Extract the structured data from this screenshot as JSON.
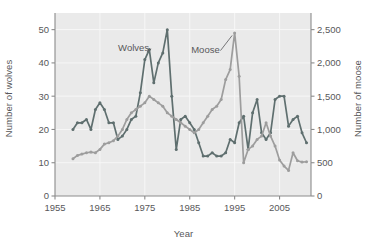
{
  "chart_data": {
    "type": "line",
    "title": "",
    "xlabel": "Year",
    "ylabel": "Number of wolves",
    "ylabel_right": "Number of moose",
    "grid": true,
    "legend_position": "inline-annotations",
    "xlim": [
      1955,
      2012
    ],
    "xticks": [
      1955,
      1965,
      1975,
      1985,
      1995,
      2005
    ],
    "xtick_labels": [
      "1955",
      "1965",
      "1975",
      "1985",
      "1995",
      "2005"
    ],
    "ylim_left": [
      0,
      55
    ],
    "yticks_left": [
      0,
      10,
      20,
      30,
      40,
      50
    ],
    "ytick_labels_left": [
      "0",
      "10",
      "20",
      "30",
      "40",
      "50"
    ],
    "ylim_right": [
      0,
      2750
    ],
    "yticks_right": [
      0,
      500,
      1000,
      1500,
      2000,
      2500
    ],
    "ytick_labels_right": [
      "0",
      "500",
      "1,000",
      "1,500",
      "2,000",
      "2,500"
    ],
    "colors": {
      "wolves": "#5f6f6f",
      "moose": "#9d9d9d",
      "plot_background": "#eaeaea",
      "gridline": "#f7f7f7",
      "axis": "#8b8b8b",
      "text": "#58585a"
    },
    "series": [
      {
        "name": "Wolves",
        "axis": "left",
        "color": "#5f6f6f",
        "annotation": "Wolves",
        "x": [
          1959,
          1960,
          1961,
          1962,
          1963,
          1964,
          1965,
          1966,
          1967,
          1968,
          1969,
          1970,
          1971,
          1972,
          1973,
          1974,
          1975,
          1976,
          1977,
          1978,
          1979,
          1980,
          1981,
          1982,
          1983,
          1984,
          1985,
          1986,
          1987,
          1988,
          1989,
          1990,
          1991,
          1992,
          1993,
          1994,
          1995,
          1996,
          1997,
          1998,
          1999,
          2000,
          2001,
          2002,
          2003,
          2004,
          2005,
          2006,
          2007,
          2008,
          2009,
          2010,
          2011
        ],
        "values": [
          20,
          22,
          22,
          23,
          20,
          26,
          28,
          26,
          22,
          22,
          17,
          18,
          20,
          23,
          24,
          31,
          41,
          44,
          34,
          40,
          43,
          50,
          30,
          14,
          23,
          24,
          22,
          20,
          16,
          12,
          12,
          13,
          12,
          12,
          13,
          17,
          16,
          22,
          24,
          14,
          25,
          29,
          19,
          17,
          19,
          29,
          30,
          30,
          21,
          23,
          24,
          19,
          16
        ]
      },
      {
        "name": "Moose",
        "axis": "right",
        "color": "#9d9d9d",
        "annotation": "Moose",
        "x": [
          1959,
          1960,
          1961,
          1962,
          1963,
          1964,
          1965,
          1966,
          1967,
          1968,
          1969,
          1970,
          1971,
          1972,
          1973,
          1974,
          1975,
          1976,
          1977,
          1978,
          1979,
          1980,
          1981,
          1982,
          1983,
          1984,
          1985,
          1986,
          1987,
          1988,
          1989,
          1990,
          1991,
          1992,
          1993,
          1994,
          1995,
          1996,
          1997,
          1998,
          1999,
          2000,
          2001,
          2002,
          2003,
          2004,
          2005,
          2006,
          2007,
          2008,
          2009,
          2010,
          2011
        ],
        "values": [
          560,
          610,
          630,
          650,
          660,
          650,
          700,
          780,
          800,
          830,
          900,
          1000,
          1150,
          1250,
          1300,
          1350,
          1400,
          1500,
          1450,
          1400,
          1350,
          1250,
          1200,
          1150,
          1100,
          1050,
          1000,
          950,
          1000,
          1100,
          1200,
          1300,
          1350,
          1450,
          1750,
          1900,
          2450,
          1800,
          500,
          700,
          750,
          850,
          900,
          1100,
          900,
          750,
          540,
          450,
          385,
          650,
          530,
          510,
          515
        ]
      }
    ],
    "annotations": [
      {
        "text": "Wolves",
        "x": 1972.5,
        "y_left": 44.5,
        "points_to_year": 1976
      },
      {
        "text": "Moose",
        "x": 1988.5,
        "y_right": 2200,
        "points_to_year": 1995
      }
    ]
  }
}
